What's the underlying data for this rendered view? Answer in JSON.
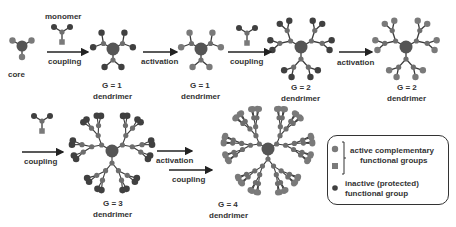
{
  "colors": {
    "core": "#555555",
    "inactive": "#404040",
    "active": "#7a7a7a",
    "branch": "#6e6e6e",
    "bond": "#3a3a3a",
    "arrow": "#222222",
    "text": "#333333"
  },
  "labels": {
    "core": "core",
    "monomer": "monomer",
    "row1": {
      "step1_arrow": "coupling",
      "g1_title": "G = 1",
      "g1_sub": "dendrimer",
      "step2_arrow": "activation",
      "g1b_title": "G = 1",
      "g1b_sub": "dendrimer",
      "step3_arrow": "coupling",
      "g2_title": "G = 2",
      "g2_sub": "dendrimer",
      "step4_arrow": "activation",
      "g2b_title": "G = 2",
      "g2b_sub": "dendrimer"
    },
    "row2": {
      "step5_arrow": "coupling",
      "g3_title": "G = 3",
      "g3_sub": "dendrimer",
      "step6_arrow": "activation",
      "step7_arrow": "coupling",
      "g4_title": "G = 4",
      "g4_sub": "dendrimer"
    }
  },
  "legend": {
    "active_line1": "active complementary",
    "active_line2": "functional groups",
    "inactive_line1": "inactive (protected)",
    "inactive_line2": "functional group"
  },
  "structures": [
    {
      "id": "core",
      "cx": 22,
      "cy": 46,
      "gen": 0,
      "end": "active",
      "scale": 1
    },
    {
      "id": "g1",
      "cx": 113,
      "cy": 49,
      "gen": 1,
      "end": "inactive",
      "scale": 1
    },
    {
      "id": "g1b",
      "cx": 201,
      "cy": 49,
      "gen": 1,
      "end": "active",
      "scale": 1
    },
    {
      "id": "g2",
      "cx": 301,
      "cy": 47,
      "gen": 2,
      "end": "inactive",
      "scale": 1
    },
    {
      "id": "g2b",
      "cx": 406,
      "cy": 47,
      "gen": 2,
      "end": "active",
      "scale": 1
    },
    {
      "id": "g3",
      "cx": 112,
      "cy": 151,
      "gen": 3,
      "end": "inactive",
      "scale": 1
    },
    {
      "id": "g4",
      "cx": 268,
      "cy": 149,
      "gen": 4,
      "end": "active",
      "scale": 1
    }
  ],
  "monomers": [
    {
      "id": "monomer-top",
      "cx": 62,
      "cy": 35
    },
    {
      "id": "monomer-mid",
      "cx": 247,
      "cy": 36
    },
    {
      "id": "monomer-bottom",
      "cx": 42,
      "cy": 124
    }
  ],
  "arrows": [
    {
      "id": "arrow-coupling-1",
      "x1": 47,
      "x2": 88,
      "y": 52
    },
    {
      "id": "arrow-activation-1",
      "x1": 143,
      "x2": 177,
      "y": 52
    },
    {
      "id": "arrow-coupling-2",
      "x1": 228,
      "x2": 271,
      "y": 52
    },
    {
      "id": "arrow-activation-2",
      "x1": 339,
      "x2": 372,
      "y": 52
    },
    {
      "id": "arrow-coupling-3",
      "x1": 22,
      "x2": 63,
      "y": 152
    },
    {
      "id": "arrow-activation-3",
      "x1": 157,
      "x2": 192,
      "y": 151
    },
    {
      "id": "arrow-coupling-4",
      "x1": 169,
      "x2": 212,
      "y": 170
    }
  ]
}
